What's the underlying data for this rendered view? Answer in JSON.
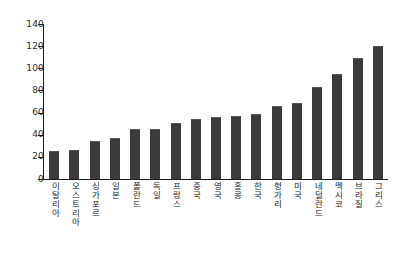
{
  "chart_data": {
    "type": "bar",
    "title": "",
    "subtitle": "",
    "xlabel": "",
    "ylabel": "",
    "ylim": [
      0,
      140
    ],
    "ytick_labels": [
      "140",
      "120",
      "100",
      "80",
      "60",
      "40",
      "20",
      "0"
    ],
    "yticks": [
      140,
      120,
      100,
      80,
      60,
      40,
      20,
      0
    ],
    "grid": false,
    "legend": null,
    "legend_position": "none",
    "bar_color": "#3b3b3b",
    "axis_color": "#1d1d1d",
    "background_color": "#ffffff",
    "categories": [
      "이탈리아",
      "오스트리아",
      "싱가포르",
      "일본",
      "폴란드",
      "독일",
      "프랑스",
      "중국",
      "영국",
      "홍콩",
      "한국",
      "헝가리",
      "미국",
      "네덜란드",
      "멕시코",
      "브라질",
      "그리스"
    ],
    "values": [
      24,
      25,
      33,
      36,
      44,
      44,
      50,
      53,
      55,
      56,
      58,
      65,
      68,
      82,
      94,
      108,
      119
    ]
  }
}
